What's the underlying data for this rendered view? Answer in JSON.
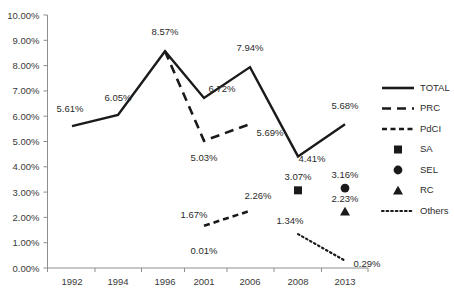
{
  "chart_data": {
    "type": "line",
    "title": "",
    "xlabel": "",
    "ylabel": "",
    "categories": [
      "1992",
      "1994",
      "1996",
      "2001",
      "2006",
      "2008",
      "2013"
    ],
    "ylim": [
      0,
      10
    ],
    "ytick_labels": [
      "0.00%",
      "1.00%",
      "2.00%",
      "3.00%",
      "4.00%",
      "5.00%",
      "6.00%",
      "7.00%",
      "8.00%",
      "9.00%",
      "10.00%"
    ],
    "ytick_values": [
      0,
      1,
      2,
      3,
      4,
      5,
      6,
      7,
      8,
      9,
      10
    ],
    "grid": false,
    "legend_position": "right",
    "series": [
      {
        "name": "TOTAL",
        "style": "solid",
        "marker": "none",
        "x": [
          "1992",
          "1994",
          "1996",
          "2001",
          "2006",
          "2008",
          "2013"
        ],
        "values": [
          5.61,
          6.05,
          8.57,
          6.72,
          7.94,
          4.41,
          5.68
        ],
        "labels": [
          "5.61%",
          "6.05%",
          "8.57%",
          "6.72%",
          "7.94%",
          "4.41%",
          "5.68%"
        ]
      },
      {
        "name": "PRC",
        "style": "long-dash",
        "marker": "none",
        "x": [
          "1996",
          "2001",
          "2006"
        ],
        "values": [
          8.57,
          5.03,
          5.69
        ],
        "labels": [
          "",
          "5.03%",
          "5.69%"
        ]
      },
      {
        "name": "PdCI",
        "style": "short-dash",
        "marker": "none",
        "x": [
          "2001",
          "2006"
        ],
        "values": [
          1.67,
          2.26
        ],
        "labels": [
          "1.67%",
          "2.26%"
        ]
      },
      {
        "name": "SA",
        "style": "none",
        "marker": "square",
        "x": [
          "2008"
        ],
        "values": [
          3.07
        ],
        "labels": [
          "3.07%"
        ]
      },
      {
        "name": "SEL",
        "style": "none",
        "marker": "circle",
        "x": [
          "2013"
        ],
        "values": [
          3.16
        ],
        "labels": [
          "3.16%"
        ]
      },
      {
        "name": "RC",
        "style": "none",
        "marker": "triangle",
        "x": [
          "2013"
        ],
        "values": [
          2.23
        ],
        "labels": [
          "2.23%"
        ]
      },
      {
        "name": "Others",
        "style": "dotted",
        "marker": "none",
        "x": [
          "2008",
          "2013"
        ],
        "values": [
          1.34,
          0.29
        ],
        "labels": [
          "1.34%",
          "0.29%"
        ]
      }
    ],
    "extra_annotations": [
      {
        "text": "0.01%",
        "x": "2001",
        "value": 0.01
      }
    ]
  },
  "legend": {
    "items": [
      {
        "label": "TOTAL",
        "glyph": "solid-line"
      },
      {
        "label": "PRC",
        "glyph": "long-dash-line"
      },
      {
        "label": "PdCI",
        "glyph": "short-dash-line"
      },
      {
        "label": "SA",
        "glyph": "square-marker"
      },
      {
        "label": "SEL",
        "glyph": "circle-marker"
      },
      {
        "label": "RC",
        "glyph": "triangle-marker"
      },
      {
        "label": "Others",
        "glyph": "dotted-line"
      }
    ]
  },
  "axis": {
    "y_labels": [
      "10.00%",
      "9.00%",
      "8.00%",
      "7.00%",
      "6.00%",
      "5.00%",
      "4.00%",
      "3.00%",
      "2.00%",
      "1.00%",
      "0.00%"
    ],
    "x_labels": [
      "1992",
      "1994",
      "1996",
      "2001",
      "2006",
      "2008",
      "2013"
    ]
  },
  "colors": {
    "series": "#1a1a1a",
    "axis": "#8d8d8d",
    "text": "#2b2b2b",
    "background": "#ffffff"
  },
  "data_labels": {
    "total": [
      "5.61%",
      "6.05%",
      "8.57%",
      "6.72%",
      "7.94%",
      "4.41%",
      "5.68%"
    ],
    "prc": [
      "5.03%",
      "5.69%"
    ],
    "pdci": [
      "1.67%",
      "2.26%"
    ],
    "sa": [
      "3.07%"
    ],
    "sel": [
      "3.16%"
    ],
    "rc": [
      "2.23%"
    ],
    "others": [
      "1.34%",
      "0.29%"
    ],
    "misc": [
      "0.01%"
    ]
  }
}
